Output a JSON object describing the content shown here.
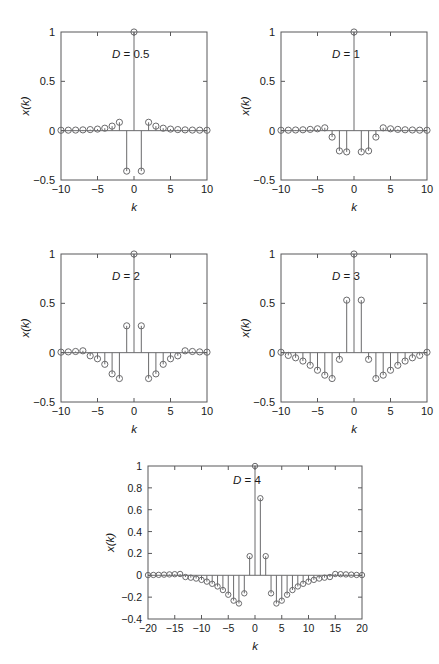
{
  "figure": {
    "background": "#ffffff",
    "stroke_color": "#58585a",
    "marker_color": "#6a6a6c",
    "axis_label_x": "k",
    "axis_label_y": "x(k)"
  },
  "chart_data": [
    {
      "type": "scatter",
      "plot_style": "stem",
      "title": "",
      "annotation": "D = 0.5",
      "annotation_symbol": "D",
      "annotation_value": "0.5",
      "xlabel": "k",
      "ylabel": "x(k)",
      "xlim": [
        -10,
        10
      ],
      "ylim": [
        -0.5,
        1
      ],
      "xticks": [
        -10,
        -5,
        0,
        5,
        10
      ],
      "xticklabels": [
        "-10",
        "-5",
        "0",
        "5",
        "10"
      ],
      "yticks": [
        -0.5,
        0,
        0.5,
        1
      ],
      "yticklabels": [
        "-0.5",
        "0",
        "0.5",
        "1"
      ],
      "grid": false,
      "legend": "none",
      "x": [
        -10,
        -9,
        -8,
        -7,
        -6,
        -5,
        -4,
        -3,
        -2,
        -1,
        0,
        1,
        2,
        3,
        4,
        5,
        6,
        7,
        8,
        9,
        10
      ],
      "values": [
        0.004,
        0.005,
        0.006,
        0.008,
        0.011,
        0.016,
        0.025,
        0.046,
        0.085,
        -0.41,
        1.0,
        -0.41,
        0.085,
        0.046,
        0.025,
        0.016,
        0.011,
        0.008,
        0.006,
        0.005,
        0.004
      ]
    },
    {
      "type": "scatter",
      "plot_style": "stem",
      "title": "",
      "annotation": "D = 1",
      "annotation_symbol": "D",
      "annotation_value": "1",
      "xlabel": "k",
      "ylabel": "x(k)",
      "xlim": [
        -10,
        10
      ],
      "ylim": [
        -0.5,
        1
      ],
      "xticks": [
        -10,
        -5,
        0,
        5,
        10
      ],
      "xticklabels": [
        "-10",
        "-5",
        "0",
        "5",
        "10"
      ],
      "yticks": [
        -0.5,
        0,
        0.5,
        1
      ],
      "yticklabels": [
        "-0.5",
        "0",
        "0.5",
        "1"
      ],
      "grid": false,
      "legend": "none",
      "x": [
        -10,
        -9,
        -8,
        -7,
        -6,
        -5,
        -4,
        -3,
        -2,
        -1,
        0,
        1,
        2,
        3,
        4,
        5,
        6,
        7,
        8,
        9,
        10
      ],
      "values": [
        0.004,
        0.005,
        0.007,
        0.009,
        0.013,
        0.019,
        0.029,
        -0.065,
        -0.205,
        -0.215,
        1.0,
        -0.215,
        -0.205,
        -0.065,
        0.029,
        0.019,
        0.013,
        0.009,
        0.007,
        0.005,
        0.004
      ]
    },
    {
      "type": "scatter",
      "plot_style": "stem",
      "title": "",
      "annotation": "D = 2",
      "annotation_symbol": "D",
      "annotation_value": "2",
      "xlabel": "k",
      "ylabel": "x(k)",
      "xlim": [
        -10,
        10
      ],
      "ylim": [
        -0.5,
        1
      ],
      "xticks": [
        -10,
        -5,
        0,
        5,
        10
      ],
      "xticklabels": [
        "-10",
        "-5",
        "0",
        "5",
        "10"
      ],
      "yticks": [
        -0.5,
        0,
        0.5,
        1
      ],
      "yticklabels": [
        "-0.5",
        "0",
        "0.5",
        "1"
      ],
      "grid": false,
      "legend": "none",
      "x": [
        -10,
        -9,
        -8,
        -7,
        -6,
        -5,
        -4,
        -3,
        -2,
        -1,
        0,
        1,
        2,
        3,
        4,
        5,
        6,
        7,
        8,
        9,
        10
      ],
      "values": [
        0.005,
        0.008,
        0.012,
        0.019,
        -0.032,
        -0.062,
        -0.118,
        -0.215,
        -0.262,
        0.272,
        1.0,
        0.272,
        -0.262,
        -0.215,
        -0.118,
        -0.062,
        -0.032,
        0.019,
        0.012,
        0.008,
        0.005
      ]
    },
    {
      "type": "scatter",
      "plot_style": "stem",
      "title": "",
      "annotation": "D = 3",
      "annotation_symbol": "D",
      "annotation_value": "3",
      "xlabel": "k",
      "ylabel": "x(k)",
      "xlim": [
        -10,
        10
      ],
      "ylim": [
        -0.5,
        1
      ],
      "xticks": [
        -10,
        -5,
        0,
        5,
        10
      ],
      "xticklabels": [
        "-10",
        "-5",
        "0",
        "5",
        "10"
      ],
      "yticks": [
        -0.5,
        0,
        0.5,
        1
      ],
      "yticklabels": [
        "-0.5",
        "0",
        "0.5",
        "1"
      ],
      "grid": false,
      "legend": "none",
      "x": [
        -10,
        -9,
        -8,
        -7,
        -6,
        -5,
        -4,
        -3,
        -2,
        -1,
        0,
        1,
        2,
        3,
        4,
        5,
        6,
        7,
        8,
        9,
        10
      ],
      "values": [
        0.004,
        -0.028,
        -0.052,
        -0.085,
        -0.128,
        -0.178,
        -0.228,
        -0.262,
        -0.068,
        0.532,
        1.0,
        0.532,
        -0.068,
        -0.262,
        -0.228,
        -0.178,
        -0.128,
        -0.085,
        -0.052,
        -0.028,
        0.004
      ]
    },
    {
      "type": "scatter",
      "plot_style": "stem",
      "title": "",
      "annotation": "D = 4",
      "annotation_symbol": "D",
      "annotation_value": "4",
      "xlabel": "k",
      "ylabel": "x(k)",
      "xlim": [
        -20,
        20
      ],
      "ylim": [
        -0.4,
        1
      ],
      "xticks": [
        -20,
        -15,
        -10,
        -5,
        0,
        5,
        10,
        15,
        20
      ],
      "xticklabels": [
        "-20",
        "-15",
        "-10",
        "-5",
        "0",
        "5",
        "10",
        "15",
        "20"
      ],
      "yticks": [
        -0.4,
        -0.2,
        0,
        0.2,
        0.4,
        0.6,
        0.8,
        1
      ],
      "yticklabels": [
        "-0.4",
        "-0.2",
        "0",
        "0.2",
        "0.4",
        "0.6",
        "0.8",
        "1"
      ],
      "grid": false,
      "legend": "none",
      "x": [
        -20,
        -19,
        -18,
        -17,
        -16,
        -15,
        -14,
        -13,
        -12,
        -11,
        -10,
        -9,
        -8,
        -7,
        -6,
        -5,
        -4,
        -3,
        -2,
        -1,
        0,
        1,
        2,
        3,
        4,
        5,
        6,
        7,
        8,
        9,
        10,
        11,
        12,
        13,
        14,
        15,
        16,
        17,
        18,
        19,
        20
      ],
      "values": [
        0.002,
        0.003,
        0.004,
        0.006,
        0.008,
        0.01,
        0.012,
        -0.016,
        -0.022,
        -0.03,
        -0.042,
        -0.058,
        -0.078,
        -0.102,
        -0.135,
        -0.178,
        -0.232,
        -0.258,
        -0.165,
        0.175,
        1.0,
        0.705,
        0.175,
        -0.165,
        -0.258,
        -0.232,
        -0.178,
        -0.135,
        -0.102,
        -0.078,
        -0.058,
        -0.042,
        -0.03,
        -0.022,
        -0.016,
        0.012,
        0.01,
        0.008,
        0.006,
        0.003,
        0.002
      ]
    }
  ]
}
